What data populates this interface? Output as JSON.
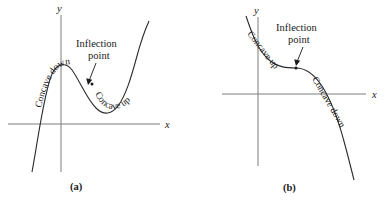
{
  "figure": {
    "panels": [
      {
        "id": "a",
        "caption": "(a)",
        "axes": {
          "x_label": "x",
          "y_label": "y"
        },
        "annotations": {
          "inflection_line1": "Inflection",
          "inflection_line2": "point"
        },
        "curve_labels": {
          "left": "Concave",
          "left2": "down",
          "right": "Concave up"
        },
        "curve_description": "cubic-like curve: rises from lower left to a local maximum, falls to a local minimum, then rises steeply to the upper right"
      },
      {
        "id": "b",
        "caption": "(b)",
        "axes": {
          "x_label": "x",
          "y_label": "y"
        },
        "annotations": {
          "inflection_line1": "Inflection",
          "inflection_line2": "point"
        },
        "curve_labels": {
          "left": "Concave up",
          "right": "Concave down"
        },
        "curve_description": "decreasing curve, concave up on the left, concave down on the right, crossing the x-axis near the right"
      }
    ]
  },
  "colors": {
    "curve": "#2b2b2b",
    "axis": "#7c7c7c",
    "text": "#1a1a1a",
    "background": "#ffffff"
  }
}
